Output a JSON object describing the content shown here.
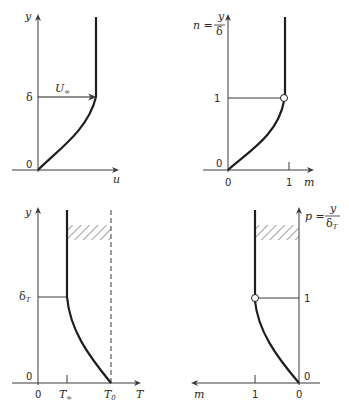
{
  "panels": [
    {
      "id": "velocity-profile",
      "y_axis_label": "y",
      "x_axis_label": "u",
      "origin_label": "0",
      "level_label": "δ",
      "arrow_label": "U",
      "arrow_label_sub": "∞"
    },
    {
      "id": "dimensionless-velocity-profile",
      "y_axis_label_lhs": "n =",
      "y_axis_frac_num": "y",
      "y_axis_frac_den": "δ",
      "x_axis_label": "m",
      "origin_y_label": "0",
      "origin_x_label": "0",
      "level_label": "1",
      "x_tick_label": "1"
    },
    {
      "id": "temperature-profile",
      "y_axis_label": "y",
      "x_axis_label": "T",
      "origin_y_label": "0",
      "origin_x_label": "0",
      "level_label": "δ",
      "level_label_sub": "T",
      "tick_inf_label": "T",
      "tick_inf_sub": "∞",
      "tick_wall_label": "T",
      "tick_wall_sub": "0"
    },
    {
      "id": "dimensionless-temperature-profile",
      "y_axis_label_lhs": "p =",
      "y_axis_frac_num": "y",
      "y_axis_frac_den": "δ",
      "y_axis_frac_den_sub": "T",
      "x_axis_label": "m",
      "origin_y_label": "0",
      "origin_x_label": "0",
      "level_label": "1",
      "x_tick_label": "1"
    }
  ],
  "colors": {
    "line": "#1e1e1e",
    "axis": "#3a3a3a"
  }
}
